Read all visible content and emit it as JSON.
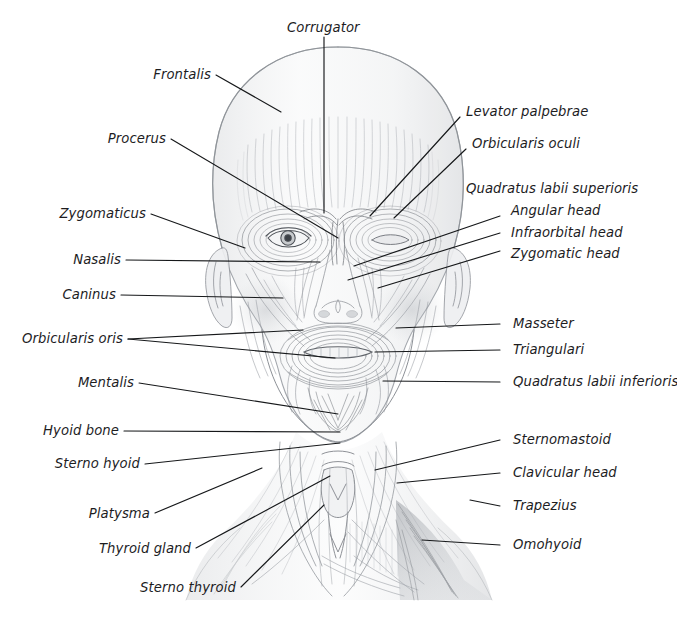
{
  "document": {
    "title": "Facial and neck musculature — anterior view",
    "medium": "pencil anatomical illustration",
    "background_color": "#ffffff",
    "ink_color": "#1d1d1f",
    "leader_line_color": "#16181a",
    "graphite_color": "#8d9196",
    "cropped_header_fragment": "                    "
  },
  "labels": {
    "corrugator": "Corrugator",
    "frontalis": "Frontalis",
    "procerus": "Procerus",
    "zygomaticus": "Zygomaticus",
    "nasalis": "Nasalis",
    "caninus": "Caninus",
    "orbicularis_oris": "Orbicularis oris",
    "mentalis": "Mentalis",
    "hyoid_bone": "Hyoid bone",
    "sterno_hyoid": "Sterno hyoid",
    "platysma": "Platysma",
    "thyroid_gland": "Thyroid gland",
    "sterno_thyroid": "Sterno thyroid",
    "levator_palpebrae": "Levator palpebrae",
    "orbicularis_oculi": "Orbicularis oculi",
    "quadratus_labii_superioris": "Quadratus labii superioris",
    "angular_head": "Angular head",
    "infraorbital_head": "Infraorbital head",
    "zygomatic_head": "Zygomatic head",
    "masseter": "Masseter",
    "triangulari": "Triangulari",
    "quadratus_labii_inferioris": "Quadratus labii inferioris",
    "sternomastoid": "Sternomastoid",
    "clavicular_head": "Clavicular head",
    "trapezius": "Trapezius",
    "omohyoid": "Omohyoid"
  },
  "label_groups": [
    {
      "side": "left",
      "items": [
        "Frontalis",
        "Procerus",
        "Zygomaticus",
        "Nasalis",
        "Caninus",
        "Orbicularis oris",
        "Mentalis",
        "Hyoid bone",
        "Sterno hyoid",
        "Platysma",
        "Thyroid gland",
        "Sterno thyroid"
      ]
    },
    {
      "side": "top",
      "items": [
        "Corrugator"
      ]
    },
    {
      "side": "right",
      "items": [
        "Levator palpebrae",
        "Orbicularis oculi",
        "Quadratus labii superioris",
        "Angular head",
        "Infraorbital head",
        "Zygomatic head",
        "Masseter",
        "Triangulari",
        "Quadratus labii inferioris",
        "Sternomastoid",
        "Clavicular head",
        "Trapezius",
        "Omohyoid"
      ]
    }
  ]
}
